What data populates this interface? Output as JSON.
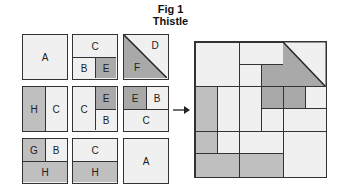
{
  "figure": {
    "number_label": "Fig 1",
    "title": "Thistle"
  },
  "colors": {
    "light": "#f0f0f0",
    "medium_grey": "#bfbfbf",
    "dark_grey": "#a9a9a9",
    "outline": "#333333"
  },
  "blocks": [
    {
      "row": 1,
      "col": 1,
      "labels": [
        "A"
      ]
    },
    {
      "row": 1,
      "col": 2,
      "labels": [
        "C",
        "B",
        "E"
      ]
    },
    {
      "row": 1,
      "col": 3,
      "labels": [
        "D",
        "F"
      ]
    },
    {
      "row": 2,
      "col": 1,
      "labels": [
        "H",
        "C"
      ]
    },
    {
      "row": 2,
      "col": 2,
      "labels": [
        "C",
        "E",
        "B"
      ]
    },
    {
      "row": 2,
      "col": 3,
      "labels": [
        "E",
        "B",
        "C"
      ]
    },
    {
      "row": 3,
      "col": 1,
      "labels": [
        "G",
        "B",
        "H"
      ]
    },
    {
      "row": 3,
      "col": 2,
      "labels": [
        "C",
        "H"
      ]
    },
    {
      "row": 3,
      "col": 3,
      "labels": [
        "A"
      ]
    }
  ],
  "arrow": {
    "direction": "right"
  }
}
